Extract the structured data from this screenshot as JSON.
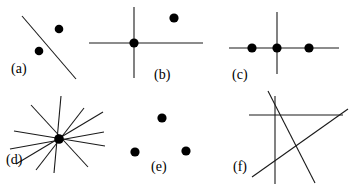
{
  "figure": {
    "width": 359,
    "height": 186,
    "background": "#ffffff",
    "ink_color": "#1a1a1a",
    "dot_color": "#000000",
    "label_color": "#000000",
    "type": "point-line incidence configurations",
    "panel_labels": [
      "(a)",
      "(b)",
      "(c)",
      "(d)",
      "(e)",
      "(f)"
    ]
  },
  "panels": [
    {
      "id": "a",
      "label": "(a)",
      "label_pos": {
        "x": 11,
        "y": 62
      },
      "description": "one line with one incident point and one isolated point off the line",
      "lines": [
        {
          "x1": 22,
          "y1": 16,
          "x2": 76,
          "y2": 79
        }
      ],
      "dots": [
        {
          "x": 39,
          "y": 51,
          "r": 4.3,
          "on_line": true
        },
        {
          "x": 59,
          "y": 29,
          "r": 4.3,
          "on_line": false
        }
      ]
    },
    {
      "id": "b",
      "label": "(b)",
      "label_pos": {
        "x": 154,
        "y": 68
      },
      "description": "two crossing lines meeting in one point, plus one isolated point",
      "lines": [
        {
          "x1": 134,
          "y1": 7,
          "x2": 134,
          "y2": 78
        },
        {
          "x1": 89,
          "y1": 43,
          "x2": 203,
          "y2": 43
        }
      ],
      "dots": [
        {
          "x": 134,
          "y": 43,
          "r": 4.6,
          "on_line": true
        },
        {
          "x": 174,
          "y": 18,
          "r": 4.6,
          "on_line": false
        }
      ]
    },
    {
      "id": "c",
      "label": "(c)",
      "label_pos": {
        "x": 232,
        "y": 68
      },
      "description": "two crossing lines with three collinear points on the horizontal line",
      "lines": [
        {
          "x1": 277,
          "y1": 12,
          "x2": 277,
          "y2": 74
        },
        {
          "x1": 229,
          "y1": 48,
          "x2": 339,
          "y2": 48
        }
      ],
      "dots": [
        {
          "x": 252,
          "y": 48,
          "r": 4.6,
          "on_line": true
        },
        {
          "x": 277,
          "y": 48,
          "r": 4.6,
          "on_line": true
        },
        {
          "x": 309,
          "y": 48,
          "r": 4.6,
          "on_line": true
        }
      ]
    },
    {
      "id": "d",
      "label": "(d)",
      "label_pos": {
        "x": 6,
        "y": 153
      },
      "description": "pencil of six concurrent lines through a single common point",
      "lines": [
        {
          "x1": 61,
          "y1": 96,
          "x2": 54,
          "y2": 173
        },
        {
          "x1": 31,
          "y1": 105,
          "x2": 88,
          "y2": 167
        },
        {
          "x1": 14,
          "y1": 131,
          "x2": 105,
          "y2": 146
        },
        {
          "x1": 16,
          "y1": 164,
          "x2": 103,
          "y2": 112
        },
        {
          "x1": 36,
          "y1": 170,
          "x2": 84,
          "y2": 108
        },
        {
          "x1": 10,
          "y1": 149,
          "x2": 104,
          "y2": 132
        }
      ],
      "dots": [
        {
          "x": 59,
          "y": 139,
          "r": 4.8,
          "on_line": true
        }
      ]
    },
    {
      "id": "e",
      "label": "(e)",
      "label_pos": {
        "x": 151,
        "y": 160
      },
      "description": "three points in general position with no drawn lines",
      "lines": [],
      "dots": [
        {
          "x": 162,
          "y": 118,
          "r": 4.6,
          "on_line": false
        },
        {
          "x": 135,
          "y": 152,
          "r": 4.6,
          "on_line": false
        },
        {
          "x": 186,
          "y": 151,
          "r": 4.6,
          "on_line": false
        }
      ]
    },
    {
      "id": "f",
      "label": "(f)",
      "label_pos": {
        "x": 233,
        "y": 160
      },
      "description": "four lines in general position with no marked points",
      "lines": [
        {
          "x1": 275,
          "y1": 96,
          "x2": 275,
          "y2": 184
        },
        {
          "x1": 249,
          "y1": 115,
          "x2": 343,
          "y2": 115
        },
        {
          "x1": 268,
          "y1": 91,
          "x2": 315,
          "y2": 183
        },
        {
          "x1": 252,
          "y1": 177,
          "x2": 348,
          "y2": 109
        }
      ],
      "dots": []
    }
  ]
}
